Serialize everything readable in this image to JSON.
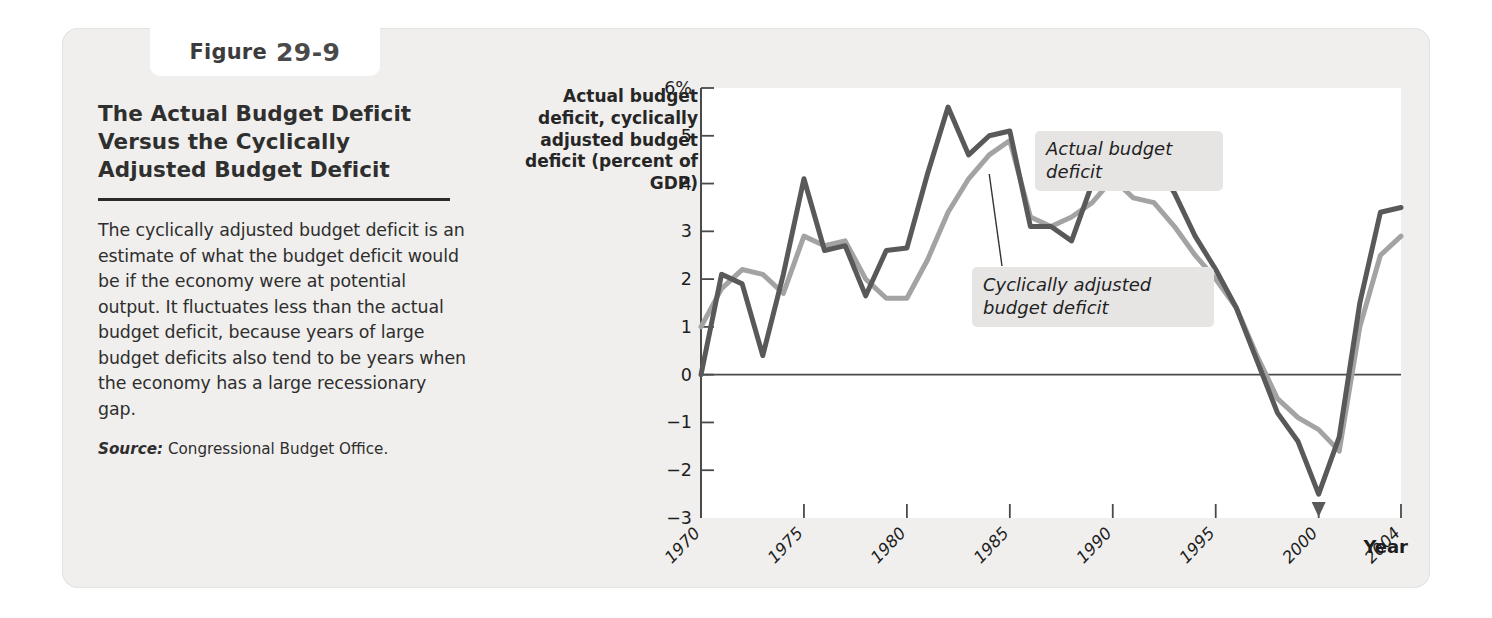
{
  "figure": {
    "label_word": "Figure",
    "number": "29-9",
    "title": "The Actual Budget Deficit Versus the Cyclically Adjusted Budget Deficit",
    "caption": "The cyclically adjusted budget deficit is an estimate of what the budget deficit would be if the economy were at potential output. It fluctuates less than the actual budget deficit, because years of large budget deficits also tend to be years when the economy has a large recessionary gap.",
    "source_label": "Source:",
    "source_text": "Congressional Budget Office."
  },
  "annotations": {
    "actual": "Actual budget deficit",
    "cyclical": "Cyclically adjusted budget deficit"
  },
  "colors": {
    "actual_line": "#595959",
    "cyclical_line": "#a3a3a3",
    "panel_bg": "#f0efed",
    "plot_bg": "#ffffff",
    "axis": "#4a4a4a",
    "callout_bg": "#e6e5e3"
  },
  "chart_data": {
    "type": "line",
    "title": "The Actual Budget Deficit Versus the Cyclically Adjusted Budget Deficit",
    "xlabel": "Year",
    "ylabel": "Actual budget deficit, cyclically adjusted budget deficit (percent of GDP)",
    "ylim": [
      -3,
      6
    ],
    "xlim": [
      1970,
      2004
    ],
    "ytick_labels": [
      "6%",
      "5",
      "4",
      "3",
      "2",
      "1",
      "0",
      "-1",
      "-2",
      "-3"
    ],
    "ytick_values": [
      6,
      5,
      4,
      3,
      2,
      1,
      0,
      -1,
      -2,
      -3
    ],
    "xtick_labels": [
      "1970",
      "1975",
      "1980",
      "1985",
      "1990",
      "1995",
      "2000",
      "2004"
    ],
    "xtick_values": [
      1970,
      1975,
      1980,
      1985,
      1990,
      1995,
      2000,
      2004
    ],
    "grid": false,
    "zero_line": true,
    "legend_position": "inline-annotations",
    "x": [
      1970,
      1971,
      1972,
      1973,
      1974,
      1975,
      1976,
      1977,
      1978,
      1979,
      1980,
      1981,
      1982,
      1983,
      1984,
      1985,
      1986,
      1987,
      1988,
      1989,
      1990,
      1991,
      1992,
      1993,
      1994,
      1995,
      1996,
      1997,
      1998,
      1999,
      2000,
      2001,
      2002,
      2003,
      2004
    ],
    "series": [
      {
        "name": "Actual budget deficit",
        "color": "#595959",
        "values": [
          0.0,
          2.1,
          1.9,
          0.4,
          2.1,
          4.1,
          2.6,
          2.7,
          1.65,
          2.6,
          2.65,
          4.2,
          5.6,
          4.6,
          5.0,
          5.1,
          3.1,
          3.1,
          2.8,
          4.0,
          4.4,
          4.5,
          4.5,
          3.8,
          2.9,
          2.2,
          1.4,
          0.3,
          -0.8,
          -1.4,
          -2.5,
          -1.3,
          1.5,
          3.4,
          3.5
        ]
      },
      {
        "name": "Cyclically adjusted budget deficit",
        "color": "#a3a3a3",
        "values": [
          1.0,
          1.8,
          2.2,
          2.1,
          1.7,
          2.9,
          2.7,
          2.8,
          2.0,
          1.6,
          1.6,
          2.4,
          3.4,
          4.1,
          4.6,
          4.9,
          3.3,
          3.1,
          3.3,
          3.6,
          4.1,
          3.7,
          3.6,
          3.1,
          2.5,
          2.0,
          1.4,
          0.4,
          -0.5,
          -0.9,
          -1.15,
          -1.6,
          1.0,
          2.5,
          2.9
        ]
      }
    ],
    "annotations": [
      {
        "text": "Actual budget deficit",
        "points_to_year": 1991,
        "points_to_value": 4.5
      },
      {
        "text": "Cyclically adjusted budget deficit",
        "points_to_year": 1984,
        "points_to_value": 4.2
      }
    ]
  }
}
